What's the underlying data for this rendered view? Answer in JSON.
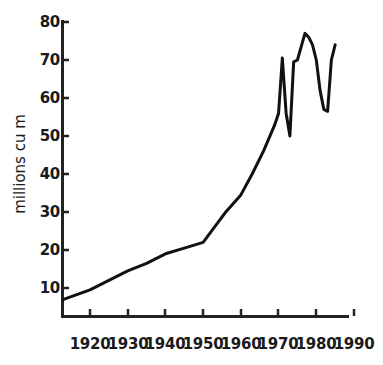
{
  "chart_data": {
    "type": "line",
    "title": "",
    "subtitle": "",
    "xlabel": "",
    "ylabel": "millions cu m",
    "xlim": [
      1913,
      1990
    ],
    "ylim": [
      0,
      80
    ],
    "xticks": [
      1920,
      1930,
      1940,
      1950,
      1960,
      1970,
      1980,
      1990
    ],
    "yticks": [
      10,
      20,
      30,
      40,
      50,
      60,
      70,
      80
    ],
    "xtick_labels": [
      "1920",
      "1930",
      "1940",
      "1950",
      "1960",
      "1970",
      "1980",
      "1990"
    ],
    "ytick_labels": [
      "10",
      "20",
      "30",
      "40",
      "50",
      "60",
      "70",
      "80"
    ],
    "grid": false,
    "legend": false,
    "legend_position": "none",
    "line_color": "#111111",
    "line_width": 3,
    "axis_color": "#222222",
    "background_color": "#ffffff",
    "series": [
      {
        "name": "production",
        "x": [
          1913,
          1920,
          1925,
          1930,
          1935,
          1940,
          1945,
          1950,
          1953,
          1956,
          1960,
          1963,
          1966,
          1969,
          1970,
          1971,
          1972,
          1973,
          1974,
          1975,
          1976,
          1977,
          1978,
          1979,
          1980,
          1981,
          1982,
          1983,
          1984,
          1985
        ],
        "y": [
          7,
          9.5,
          12,
          14.5,
          16.5,
          19,
          20.5,
          22,
          26,
          30,
          34.5,
          40,
          46,
          53,
          56,
          70.5,
          56,
          50,
          69.5,
          70,
          73.5,
          77,
          76,
          74,
          70,
          62,
          57,
          56.5,
          70,
          74
        ]
      }
    ]
  },
  "axes": {
    "y_title": "millions cu m",
    "y_tick_values": [
      "80",
      "70",
      "60",
      "50",
      "40",
      "30",
      "20",
      "10"
    ],
    "x_tick_values": [
      "1920",
      "1930",
      "1940",
      "1950",
      "1960",
      "1970",
      "1980",
      "1990"
    ]
  }
}
